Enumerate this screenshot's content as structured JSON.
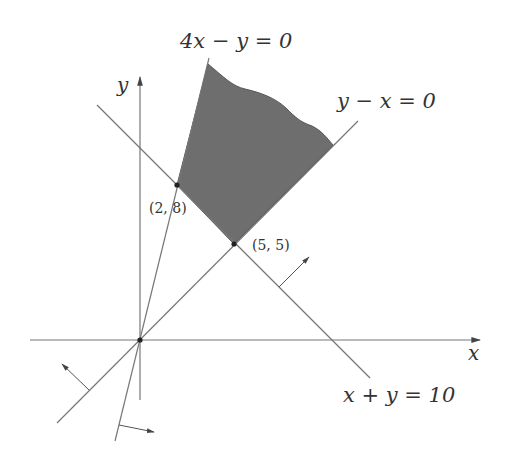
{
  "diagram": {
    "type": "linear-programming-feasible-region",
    "axes": {
      "x_label": "x",
      "y_label": "y"
    },
    "constraint_lines": [
      {
        "equation": "4x − y = 0"
      },
      {
        "equation": "y − x = 0"
      },
      {
        "equation": "x + y = 10"
      }
    ],
    "vertices": [
      {
        "label": "(2, 8)"
      },
      {
        "label": "(5, 5)"
      }
    ],
    "colors": {
      "region_fill": "#6e6e6e",
      "line": "#777777",
      "text": "#333333"
    }
  }
}
